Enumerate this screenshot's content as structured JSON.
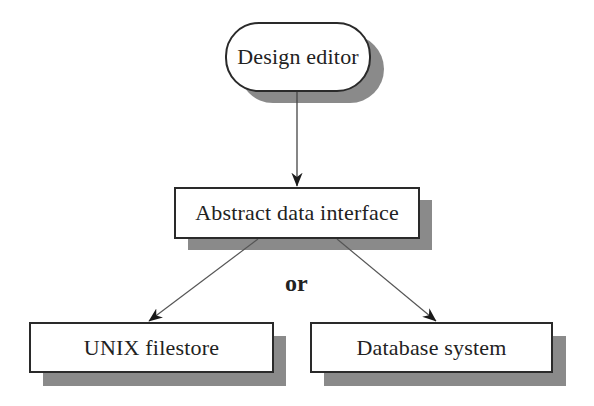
{
  "diagram": {
    "type": "flowchart",
    "nodes": [
      {
        "id": "design_editor",
        "label": "Design editor",
        "shape": "rounded-pill"
      },
      {
        "id": "abstract_data_interface",
        "label": "Abstract data interface",
        "shape": "rectangle"
      },
      {
        "id": "unix_filestore",
        "label": "UNIX filestore",
        "shape": "rectangle"
      },
      {
        "id": "database_system",
        "label": "Database system",
        "shape": "rectangle"
      }
    ],
    "edges": [
      {
        "from": "design_editor",
        "to": "abstract_data_interface"
      },
      {
        "from": "abstract_data_interface",
        "to": "unix_filestore"
      },
      {
        "from": "abstract_data_interface",
        "to": "database_system"
      }
    ],
    "branch_label": "or"
  },
  "colors": {
    "stroke": "#2a2a2a",
    "shadow": "#b0b0b0",
    "background": "#ffffff"
  }
}
